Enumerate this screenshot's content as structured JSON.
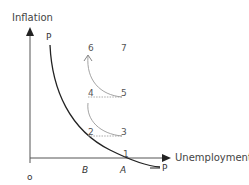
{
  "diagram": {
    "y_axis_label": "Inflation",
    "x_axis_label": "Unemployment",
    "origin_label": "o",
    "curve_label_top": "P",
    "curve_label_bottom": "P",
    "x_markers": [
      "B",
      "A"
    ],
    "points": [
      {
        "id": "1",
        "label": "1"
      },
      {
        "id": "2",
        "label": "2"
      },
      {
        "id": "3",
        "label": "3"
      },
      {
        "id": "4",
        "label": "4"
      },
      {
        "id": "5",
        "label": "5"
      },
      {
        "id": "6",
        "label": "6"
      },
      {
        "id": "7",
        "label": "7"
      }
    ],
    "colors": {
      "axis": "#555555",
      "curve": "#222222",
      "path": "#999999",
      "dotted": "#aaaaaa"
    }
  }
}
